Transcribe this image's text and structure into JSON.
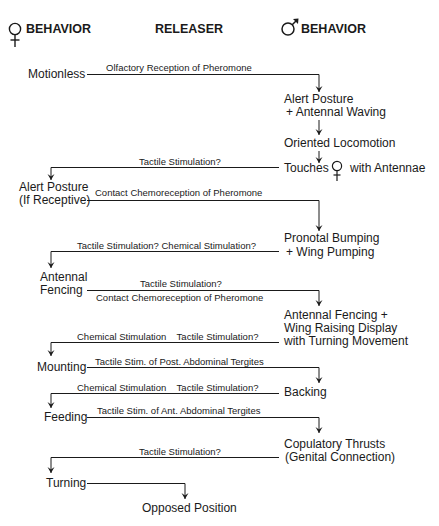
{
  "headers": {
    "female_behavior": "BEHAVIOR",
    "releaser": "RELEASER",
    "male_behavior": "BEHAVIOR"
  },
  "symbols": {
    "female": "female-symbol",
    "male": "male-symbol"
  },
  "steps": [
    {
      "id": "s1",
      "female": "Motionless",
      "releaser": "Olfactory Reception of Pheromone",
      "direction": "female-to-male"
    },
    {
      "id": "s2",
      "male": [
        "Alert Posture",
        "+ Antennal Waving"
      ]
    },
    {
      "id": "s3",
      "male": "Oriented Locomotion"
    },
    {
      "id": "s4",
      "male": {
        "before": "Touches",
        "after": "with Antennae"
      },
      "releaser": "Tactile Stimulation?",
      "direction": "male-to-female"
    },
    {
      "id": "s5",
      "female": [
        "Alert Posture",
        "(If Receptive)"
      ],
      "releaser": "Contact Chemoreception of Pheromone",
      "direction": "female-to-male"
    },
    {
      "id": "s6",
      "male": [
        "Pronotal Bumping",
        "+ Wing Pumping"
      ],
      "releaser": "Tactile Stimulation?  Chemical Stimulation?",
      "direction": "male-to-female"
    },
    {
      "id": "s7",
      "female": [
        "Antennal",
        "Fencing"
      ],
      "releaser_above": "Tactile Stimulation?",
      "releaser_below": "Contact Chemoreception of Pheromone",
      "direction": "female-to-male"
    },
    {
      "id": "s8",
      "male": [
        "Antennal Fencing +",
        "Wing Raising Display",
        "with Turning Movement"
      ],
      "releaser": "Chemical Stimulation    Tactile Stimulation?",
      "direction": "male-to-female"
    },
    {
      "id": "s9",
      "female": "Mounting",
      "releaser": "Tactile Stim. of Post. Abdominal Tergites",
      "direction": "female-to-male"
    },
    {
      "id": "s10",
      "male": "Backing",
      "releaser": "Chemical Stimulation    Tactile Stimulation?",
      "direction": "male-to-female"
    },
    {
      "id": "s11",
      "female": "Feeding",
      "releaser": "Tactile Stim. of Ant. Abdominal Tergites",
      "direction": "female-to-male"
    },
    {
      "id": "s12",
      "male": [
        "Copulatory Thrusts",
        "(Genital Connection)"
      ],
      "releaser": "Tactile Stimulation?",
      "direction": "male-to-female"
    },
    {
      "id": "s13",
      "female": "Turning",
      "direction": "to-center"
    },
    {
      "id": "s14",
      "center": "Opposed Position"
    }
  ]
}
